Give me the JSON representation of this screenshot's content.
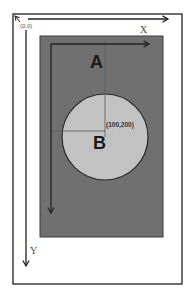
{
  "diagram": {
    "outer_frame": {
      "label": "screen",
      "origin_label": "(0,0)",
      "x_axis_label": "X",
      "y_axis_label": "Y"
    },
    "inner_view": {
      "label": "A",
      "color": "#707070"
    },
    "circle": {
      "label": "B",
      "center_label": "(100,200)",
      "color": "#c2c2c2"
    },
    "colors": {
      "background": "#ffffff",
      "frame": "#222222",
      "axis": "#222222",
      "crosshair": "#5a5a5a"
    }
  }
}
